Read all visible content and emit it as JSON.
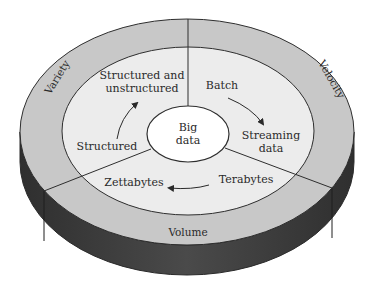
{
  "diagram": {
    "center": {
      "label_line1": "Big",
      "label_line2": "data"
    },
    "outer_ring": {
      "variety": "Variety",
      "velocity": "Velocity",
      "volume": "Volume"
    },
    "segments": {
      "variety": {
        "from": "Structured",
        "to_line1": "Structured and",
        "to_line2": "unstructured"
      },
      "velocity": {
        "from": "Batch",
        "to_line1": "Streaming",
        "to_line2": "data"
      },
      "volume": {
        "from": "Terabytes",
        "to": "Zettabytes"
      }
    },
    "colors": {
      "outer_ring": "#c8c8c8",
      "inner_area": "#ececec",
      "center": "#ffffff",
      "side": "#3f3f3f",
      "stroke": "#2e2e2e"
    }
  }
}
